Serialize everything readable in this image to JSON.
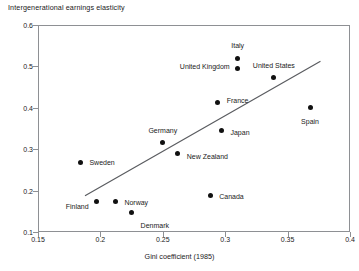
{
  "chart_data": {
    "type": "scatter",
    "title": "Intergenerational earnings elasticity",
    "xlabel": "Gini coefficient (1985)",
    "ylabel": "Intergenerational earnings elasticity",
    "xlim": [
      0.15,
      0.4
    ],
    "ylim": [
      0.1,
      0.6
    ],
    "grid": false,
    "legend": "none",
    "xticks": [
      "0.15",
      "0.2",
      "0.25",
      "0.3",
      "0.35",
      "0.4"
    ],
    "xtick_values": [
      0.15,
      0.2,
      0.25,
      0.3,
      0.35,
      0.4
    ],
    "yticks": [
      "0.1",
      "0.2",
      "0.3",
      "0.4",
      "0.5",
      "0.6"
    ],
    "ytick_values": [
      0.1,
      0.2,
      0.3,
      0.4,
      0.5,
      0.6
    ],
    "points": [
      {
        "label": "Denmark",
        "x": 0.225,
        "y": 0.147,
        "label_anchor": "left",
        "label_dx": 9,
        "label_dy": 12
      },
      {
        "label": "Norway",
        "x": 0.212,
        "y": 0.173,
        "label_anchor": "left",
        "label_dx": 9,
        "label_dy": 0
      },
      {
        "label": "Finland",
        "x": 0.197,
        "y": 0.173,
        "label_anchor": "right",
        "label_dx": -8,
        "label_dy": 4
      },
      {
        "label": "Canada",
        "x": 0.288,
        "y": 0.188,
        "label_anchor": "left",
        "label_dx": 9,
        "label_dy": 0
      },
      {
        "label": "Sweden",
        "x": 0.184,
        "y": 0.268,
        "label_anchor": "left",
        "label_dx": 9,
        "label_dy": 0
      },
      {
        "label": "New Zealand",
        "x": 0.262,
        "y": 0.29,
        "label_anchor": "left",
        "label_dx": 9,
        "label_dy": 3
      },
      {
        "label": "Germany",
        "x": 0.25,
        "y": 0.317,
        "label_anchor": "mid",
        "label_dx": 0,
        "label_dy": -12
      },
      {
        "label": "Japan",
        "x": 0.297,
        "y": 0.344,
        "label_anchor": "left",
        "label_dx": 9,
        "label_dy": 1
      },
      {
        "label": "Spain",
        "x": 0.368,
        "y": 0.4,
        "label_anchor": "mid",
        "label_dx": 0,
        "label_dy": 13
      },
      {
        "label": "France",
        "x": 0.294,
        "y": 0.414,
        "label_anchor": "left",
        "label_dx": 9,
        "label_dy": -2
      },
      {
        "label": "United States",
        "x": 0.339,
        "y": 0.474,
        "label_anchor": "mid",
        "label_dx": 0,
        "label_dy": -12
      },
      {
        "label": "United Kingdom",
        "x": 0.31,
        "y": 0.495,
        "label_anchor": "right",
        "label_dx": -8,
        "label_dy": -2
      },
      {
        "label": "Italy",
        "x": 0.31,
        "y": 0.52,
        "label_anchor": "mid",
        "label_dx": 0,
        "label_dy": -13
      }
    ],
    "trendline": {
      "x_start": 0.188,
      "y_start": 0.188,
      "x_end": 0.376,
      "y_end": 0.512,
      "color": "#5a5c60"
    }
  }
}
